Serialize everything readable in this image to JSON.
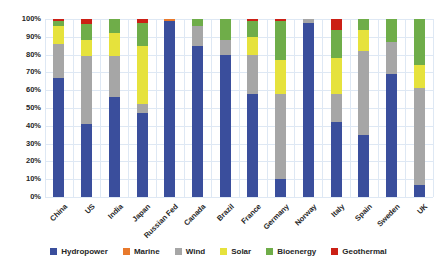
{
  "chart_data": {
    "type": "bar",
    "stacked": true,
    "units": "percent",
    "title": "",
    "xlabel": "",
    "ylabel": "",
    "ylim": [
      0,
      100
    ],
    "grid": true,
    "legend_position": "bottom",
    "y_ticks": [
      "0%",
      "10%",
      "20%",
      "30%",
      "40%",
      "50%",
      "60%",
      "70%",
      "80%",
      "90%",
      "100%"
    ],
    "categories": [
      "China",
      "US",
      "India",
      "Japan",
      "Russian Fed",
      "Canada",
      "Brazil",
      "France",
      "Germany",
      "Norway",
      "Italy",
      "Spain",
      "Sweden",
      "UK"
    ],
    "series": [
      {
        "name": "Hydropower",
        "color": "#3A4E9C",
        "values": [
          67,
          41,
          56,
          47,
          99,
          85,
          80,
          58,
          10,
          98,
          42,
          35,
          69,
          7
        ]
      },
      {
        "name": "Marine",
        "color": "#E8792C",
        "values": [
          0,
          0,
          0,
          0,
          1,
          0,
          0,
          0,
          0,
          0,
          0,
          0,
          0,
          0
        ]
      },
      {
        "name": "Wind",
        "color": "#A6A6A6",
        "values": [
          19,
          38,
          23,
          5,
          0,
          11,
          8,
          22,
          48,
          2,
          16,
          47,
          18,
          54
        ]
      },
      {
        "name": "Solar",
        "color": "#E6E23C",
        "values": [
          10,
          9,
          13,
          33,
          0,
          0,
          0,
          10,
          19,
          0,
          20,
          12,
          0,
          13
        ]
      },
      {
        "name": "Bioenergy",
        "color": "#6FAD49",
        "values": [
          3,
          9,
          8,
          13,
          0,
          4,
          12,
          9,
          22,
          0,
          16,
          6,
          13,
          26
        ]
      },
      {
        "name": "Geothermal",
        "color": "#CB2015",
        "values": [
          1,
          3,
          0,
          2,
          0,
          0,
          0,
          1,
          1,
          0,
          6,
          0,
          0,
          0
        ]
      }
    ]
  },
  "colors": {
    "background": "#ffffff",
    "gridline": "#dee8f4",
    "text": "#262626"
  }
}
